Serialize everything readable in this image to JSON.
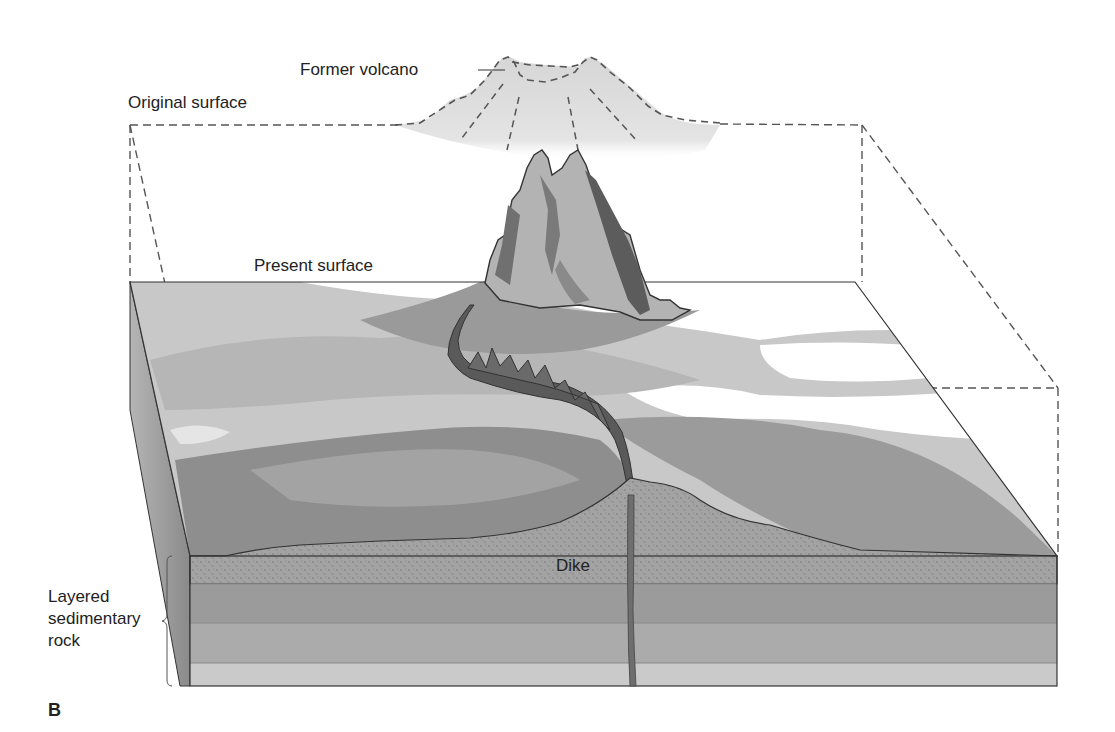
{
  "figure": {
    "panel_letter": "B",
    "labels": {
      "former_volcano": "Former volcano",
      "original_surface": "Original surface",
      "present_surface": "Present surface",
      "dike": "Dike",
      "layered_rock_line1": "Layered",
      "layered_rock_line2": "sedimentary",
      "layered_rock_line3": "rock"
    },
    "colors": {
      "background": "#ffffff",
      "former_volcano_fill": "#d9d9d9",
      "landscape_light": "#c4c4c4",
      "landscape_mid": "#a8a8a8",
      "landscape_dark": "#8c8c8c",
      "sandstone_layer": "#a3a3a3",
      "layer_2": "#9a9a9a",
      "layer_3": "#a9a9a9",
      "layer_4": "#c9c9c9",
      "dike": "#6e6e6e",
      "neck_dark": "#555555",
      "neck_light": "#b3b3b3",
      "outline": "#333333",
      "dashed_line": "#555555"
    }
  }
}
